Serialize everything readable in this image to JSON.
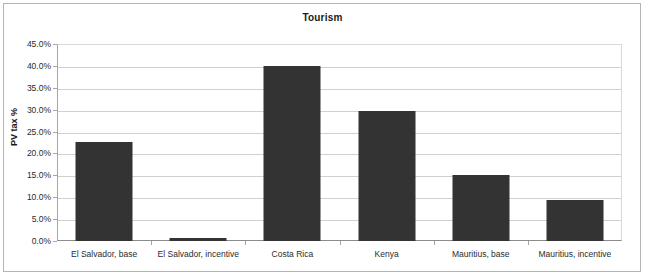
{
  "chart_data": {
    "type": "bar",
    "title": "Tourism",
    "xlabel": "",
    "ylabel": "PV tax %",
    "categories": [
      "El Salvador, base",
      "El Salvador, incentive",
      "Costa Rica",
      "Kenya",
      "Mauritius, base",
      "Mauritius, incentive"
    ],
    "values": [
      22.6,
      0.8,
      40.0,
      29.8,
      15.1,
      9.3
    ],
    "value_labels": [
      "22.6%",
      "0.8%",
      "40.0%",
      "29.8%",
      "15.1%",
      "9.3%"
    ],
    "ylim": [
      0,
      45
    ],
    "ytick_labels": [
      "0.0%",
      "5.0%",
      "10.0%",
      "15.0%",
      "20.0%",
      "25.0%",
      "30.0%",
      "35.0%",
      "40.0%",
      "45.0%"
    ],
    "ytick_values": [
      0,
      5,
      10,
      15,
      20,
      25,
      30,
      35,
      40,
      45
    ],
    "grid": true,
    "legend": false,
    "legend_position": "none",
    "series": [
      {
        "name": "PV tax %",
        "values": [
          22.6,
          0.8,
          40.0,
          29.8,
          15.1,
          9.3
        ],
        "color": "#333333"
      }
    ]
  },
  "colors": {
    "bar": "#333333",
    "gridline": "#d0d0d0",
    "axis": "#a6a6a6",
    "border": "#b4b4b4",
    "text": "#2b2b2b",
    "background": "#ffffff"
  }
}
